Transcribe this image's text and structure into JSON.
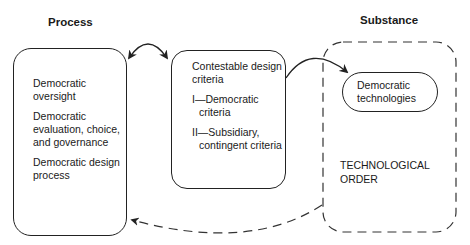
{
  "process": {
    "heading": "Process",
    "items": [
      "Democratic oversight",
      "Democratic evaluation, choice, and governance",
      "Democratic design process"
    ]
  },
  "criteria": {
    "title": "Contestable design criteria",
    "items": [
      "I—Democratic criteria",
      "II—Subsidiary, contingent criteria"
    ]
  },
  "substance": {
    "heading": "Substance",
    "inner_box": "Democratic technologies",
    "label_line1": "TECHNOLOGICAL",
    "label_line2": "ORDER"
  },
  "colors": {
    "stroke": "#222222",
    "background": "#ffffff"
  }
}
